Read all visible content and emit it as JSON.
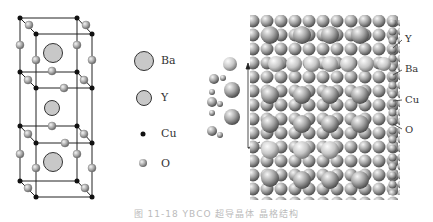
{
  "figure": {
    "caption": "图 11-18  YBCO 超导晶体  晶格结构",
    "unit_cell": {
      "description": "YBa2Cu3O7 unit cell, three stacked cubes",
      "atoms_shown": [
        "Ba",
        "Y",
        "Ba",
        "Cu",
        "O"
      ]
    },
    "legend": {
      "items": [
        {
          "symbol": "large-gray-sphere",
          "label": "Ba"
        },
        {
          "symbol": "medium-gray-sphere",
          "label": "Y"
        },
        {
          "symbol": "small-black-dot",
          "label": "Cu"
        },
        {
          "symbol": "small-shaded-sphere",
          "label": "O"
        }
      ]
    },
    "lattice_labels": [
      "Y",
      "Ba",
      "Cu",
      "O"
    ],
    "colors": {
      "ba": "#c8c8c8",
      "y": "#c8c8c8",
      "cu": "#111111",
      "o": "#a0a0a0",
      "line": "#222222"
    }
  }
}
